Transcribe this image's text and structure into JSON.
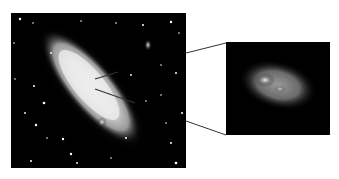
{
  "figure": {
    "main_image": {
      "label": "galaxy-photo",
      "background": "#000000",
      "galaxy_color": "#e8e8e8",
      "satellites": 2
    },
    "inset_image": {
      "label": "nucleus-closeup",
      "background": "#000000",
      "glow_color": "#d0d0d0"
    },
    "pointer_lines": 2,
    "connector_lines": 2,
    "line_color": "#333333"
  }
}
